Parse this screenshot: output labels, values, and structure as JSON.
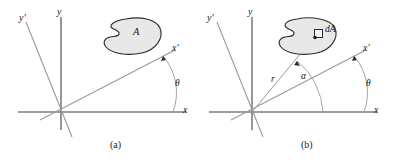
{
  "figure": {
    "type": "technical-diagram",
    "background_color": "#ffffff",
    "stroke_color": "#7d7d7d",
    "blob_fill_color": "#e8e8e8",
    "blob_stroke_color": "#2b2b2b",
    "text_color": "#1a1a1a"
  },
  "panels": [
    {
      "id": "a",
      "caption": "(a)",
      "axes": [
        {
          "name": "x-axis",
          "label": "x"
        },
        {
          "name": "y-axis",
          "label": "y"
        },
        {
          "name": "x-prime-axis",
          "label": "x'"
        },
        {
          "name": "y-prime-axis",
          "label": "y'"
        }
      ],
      "region_label": "A",
      "angles": [
        {
          "name": "theta",
          "label": "θ",
          "between": "x-axis and x-prime-axis"
        }
      ]
    },
    {
      "id": "b",
      "caption": "(b)",
      "axes": [
        {
          "name": "x-axis",
          "label": "x"
        },
        {
          "name": "y-axis",
          "label": "y"
        },
        {
          "name": "x-prime-axis",
          "label": "x'"
        },
        {
          "name": "y-prime-axis",
          "label": "y'"
        }
      ],
      "element_label": "dA",
      "radius_label": "r",
      "angles": [
        {
          "name": "alpha",
          "label": "α",
          "between": "x-axis and radius r"
        },
        {
          "name": "theta",
          "label": "θ",
          "between": "x-axis and x-prime-axis"
        }
      ]
    }
  ]
}
